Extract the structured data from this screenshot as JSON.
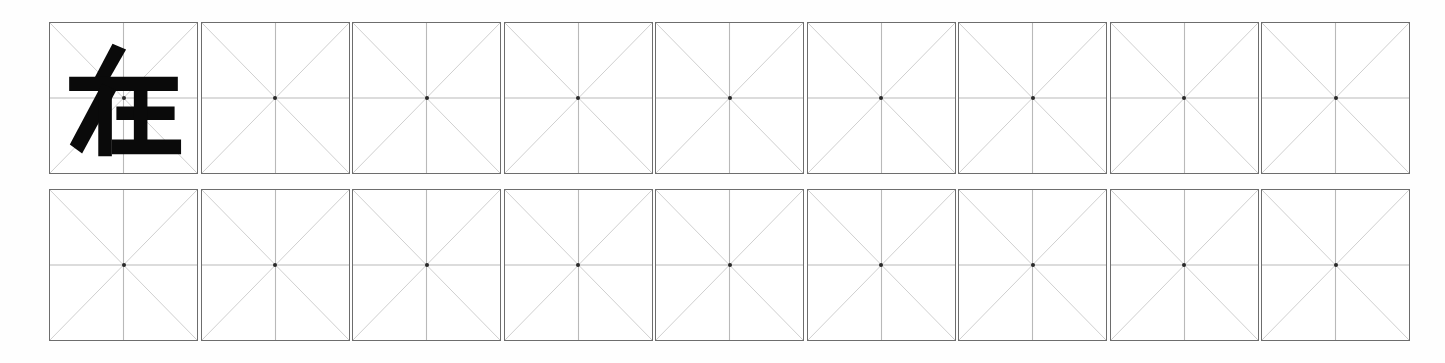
{
  "worksheet": {
    "title": "Chinese character handwriting practice sheet",
    "grid_style": "mi-zi-ge",
    "rows": 2,
    "columns": 9,
    "total_cells": 18,
    "background_color": "#ffffff",
    "cell_border_color": "#6d6d6d",
    "cross_line_color": "#b9b9b9",
    "diagonal_line_color": "#cfcfcf",
    "center_dot_color": "#2a2a2a",
    "character_color": "#0a0a0a"
  },
  "cells": [
    {
      "row": 1,
      "col": 1,
      "character": "在",
      "filled": true
    },
    {
      "row": 1,
      "col": 2,
      "character": "",
      "filled": false
    },
    {
      "row": 1,
      "col": 3,
      "character": "",
      "filled": false
    },
    {
      "row": 1,
      "col": 4,
      "character": "",
      "filled": false
    },
    {
      "row": 1,
      "col": 5,
      "character": "",
      "filled": false
    },
    {
      "row": 1,
      "col": 6,
      "character": "",
      "filled": false
    },
    {
      "row": 1,
      "col": 7,
      "character": "",
      "filled": false
    },
    {
      "row": 1,
      "col": 8,
      "character": "",
      "filled": false
    },
    {
      "row": 1,
      "col": 9,
      "character": "",
      "filled": false
    },
    {
      "row": 2,
      "col": 1,
      "character": "",
      "filled": false
    },
    {
      "row": 2,
      "col": 2,
      "character": "",
      "filled": false
    },
    {
      "row": 2,
      "col": 3,
      "character": "",
      "filled": false
    },
    {
      "row": 2,
      "col": 4,
      "character": "",
      "filled": false
    },
    {
      "row": 2,
      "col": 5,
      "character": "",
      "filled": false
    },
    {
      "row": 2,
      "col": 6,
      "character": "",
      "filled": false
    },
    {
      "row": 2,
      "col": 7,
      "character": "",
      "filled": false
    },
    {
      "row": 2,
      "col": 8,
      "character": "",
      "filled": false
    },
    {
      "row": 2,
      "col": 9,
      "character": "",
      "filled": false
    }
  ],
  "model_character": {
    "glyph": "在",
    "position_row": 1,
    "position_col": 1
  }
}
